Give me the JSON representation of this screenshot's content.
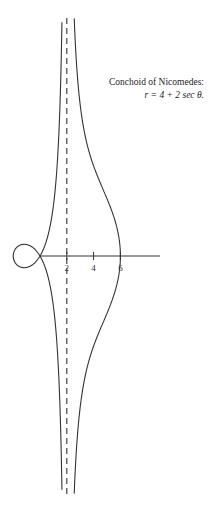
{
  "caption": {
    "title": "Conchoid of Nicomedes:",
    "equation": "r = 4 + 2 sec θ."
  },
  "chart_data": {
    "type": "line",
    "title": "Conchoid of Nicomedes: r = 4 + 2 sec θ.",
    "equation": {
      "a": 2,
      "b": 4,
      "form": "r = b + a sec θ"
    },
    "asymptote": {
      "x": 2,
      "style": "dashed"
    },
    "x_ticks": [
      2,
      4,
      6
    ],
    "x_tick_labels": [
      "2",
      "4",
      "6"
    ],
    "xlabel": "",
    "ylabel": "",
    "xlim": [
      -3,
      9
    ],
    "ylim": [
      -19,
      19
    ],
    "grid": false,
    "legend": null
  },
  "colors": {
    "curve": "#333333",
    "axis": "#333333",
    "asymptote": "#333333"
  }
}
